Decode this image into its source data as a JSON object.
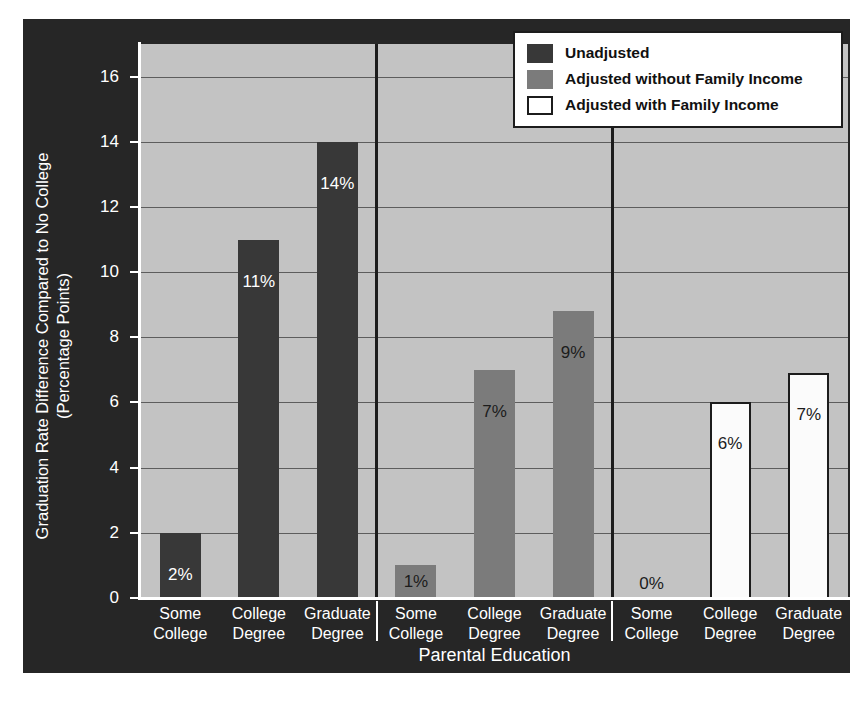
{
  "chart_data": {
    "type": "bar",
    "title": "",
    "xlabel": "Parental Education",
    "ylabel_line1": "Graduation Rate Difference Compared to No College",
    "ylabel_line2": "(Percentage Points)",
    "ylim": [
      0,
      17
    ],
    "yticks": [
      0,
      2,
      4,
      6,
      8,
      10,
      12,
      14,
      16
    ],
    "ytick_labels": [
      "0",
      "2",
      "4",
      "6",
      "8",
      "10",
      "12",
      "14",
      "16"
    ],
    "grid": true,
    "legend_position": "top-right",
    "categories": [
      "Some College",
      "College Degree",
      "Graduate Degree"
    ],
    "category_lines": [
      [
        "Some",
        "College"
      ],
      [
        "College",
        "Degree"
      ],
      [
        "Graduate",
        "Degree"
      ]
    ],
    "series": [
      {
        "name": "Unadjusted",
        "color": "#383838",
        "values": [
          2,
          11,
          14
        ],
        "labels": [
          "2%",
          "11%",
          "14%"
        ]
      },
      {
        "name": "Adjusted without Family Income",
        "color": "#7b7b7b",
        "values": [
          1,
          7,
          8.8
        ],
        "labels": [
          "1%",
          "7%",
          "9%"
        ]
      },
      {
        "name": "Adjusted with Family Income",
        "color": "#ffffff",
        "values": [
          0,
          6,
          6.9
        ],
        "labels": [
          "0%",
          "6%",
          "7%"
        ]
      }
    ]
  },
  "legend": {
    "items": [
      {
        "label": "Unadjusted",
        "swatch": "swatch-dark"
      },
      {
        "label": "Adjusted without Family Income",
        "swatch": "swatch-gray"
      },
      {
        "label": "Adjusted with Family Income",
        "swatch": "swatch-white"
      }
    ]
  },
  "colors": {
    "panel_background": "#262626",
    "plot_background": "#c3c3c3",
    "gridline": "#5d5d5d",
    "axis": "#ffffff",
    "separator": "#1c1c1c"
  }
}
